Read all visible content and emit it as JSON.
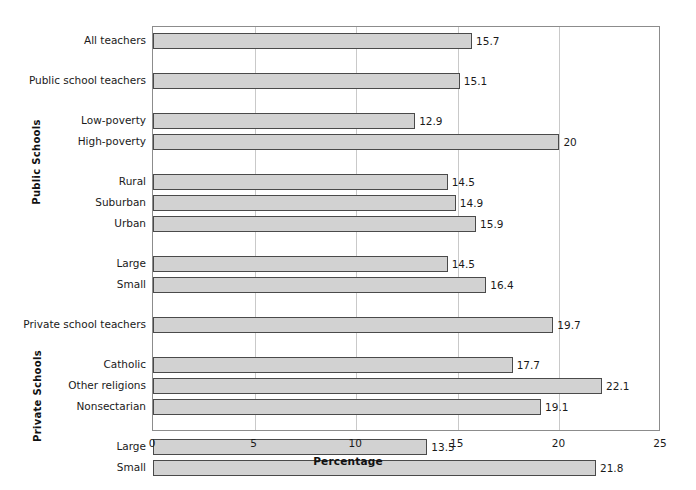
{
  "chart_data": {
    "type": "bar",
    "orientation": "horizontal",
    "title": "",
    "xlabel": "Percentage",
    "ylabel": "",
    "xlim": [
      0,
      25
    ],
    "xticks": [
      0,
      5,
      10,
      15,
      20,
      25
    ],
    "grid": true,
    "legend": false,
    "group_labels": [
      "Public Schools",
      "Private Schools"
    ],
    "categories": [
      "All teachers",
      "Public school teachers",
      "Low-poverty",
      "High-poverty",
      "Rural",
      "Suburban",
      "Urban",
      "Large",
      "Small",
      "Private school teachers",
      "Catholic",
      "Other religions",
      "Nonsectarian",
      "Large",
      "Small"
    ],
    "values": [
      15.7,
      15.1,
      12.9,
      20,
      14.5,
      14.9,
      15.9,
      14.5,
      16.4,
      19.7,
      17.7,
      22.1,
      19.1,
      13.5,
      21.8
    ],
    "value_labels": [
      "15.7",
      "15.1",
      "12.9",
      "20",
      "14.5",
      "14.9",
      "15.9",
      "14.5",
      "16.4",
      "19.7",
      "17.7",
      "22.1",
      "19.1",
      "13.5",
      "21.8"
    ],
    "bar_color": "#d2d2d2",
    "bar_border_color": "#4a4a4a",
    "grid_color": "#c9c9c9",
    "axis_color": "#8c8c8c"
  },
  "axis": {
    "x_title": "Percentage",
    "x_tick_labels": [
      "0",
      "5",
      "10",
      "15",
      "20",
      "25"
    ],
    "group_public": "Public Schools",
    "group_private": "Private Schools"
  },
  "rows": [
    {
      "label": "All teachers",
      "value": 15.7,
      "value_label": "15.7"
    },
    {
      "label": "Public school teachers",
      "value": 15.1,
      "value_label": "15.1"
    },
    {
      "label": "Low-poverty",
      "value": 12.9,
      "value_label": "12.9"
    },
    {
      "label": "High-poverty",
      "value": 20.0,
      "value_label": "20"
    },
    {
      "label": "Rural",
      "value": 14.5,
      "value_label": "14.5"
    },
    {
      "label": "Suburban",
      "value": 14.9,
      "value_label": "14.9"
    },
    {
      "label": "Urban",
      "value": 15.9,
      "value_label": "15.9"
    },
    {
      "label": "Large",
      "value": 14.5,
      "value_label": "14.5"
    },
    {
      "label": "Small",
      "value": 16.4,
      "value_label": "16.4"
    },
    {
      "label": "Private school teachers",
      "value": 19.7,
      "value_label": "19.7"
    },
    {
      "label": "Catholic",
      "value": 17.7,
      "value_label": "17.7"
    },
    {
      "label": "Other religions",
      "value": 22.1,
      "value_label": "22.1"
    },
    {
      "label": "Nonsectarian",
      "value": 19.1,
      "value_label": "19.1"
    },
    {
      "label": "Large",
      "value": 13.5,
      "value_label": "13.5"
    },
    {
      "label": "Small",
      "value": 21.8,
      "value_label": "21.8"
    }
  ]
}
